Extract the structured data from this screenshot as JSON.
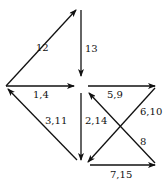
{
  "diagram": {
    "type": "directed-graph",
    "edges": [
      {
        "id": "e12",
        "label": "12",
        "from": [
          6,
          86
        ],
        "to": [
          76,
          10
        ]
      },
      {
        "id": "e13",
        "label": "13",
        "from": [
          81,
          10
        ],
        "to": [
          81,
          76
        ]
      },
      {
        "id": "e14",
        "label": "1,4",
        "from": [
          6,
          86
        ],
        "to": [
          74,
          86
        ]
      },
      {
        "id": "e311",
        "label": "3,11",
        "from": [
          77,
          160
        ],
        "to": [
          8,
          89
        ]
      },
      {
        "id": "e214",
        "label": "2,14",
        "from": [
          81,
          93
        ],
        "to": [
          81,
          160
        ]
      },
      {
        "id": "e59",
        "label": "5,9",
        "from": [
          88,
          86
        ],
        "to": [
          155,
          86
        ]
      },
      {
        "id": "e610",
        "label": "6,10",
        "from": [
          155,
          88
        ],
        "to": [
          88,
          162
        ]
      },
      {
        "id": "e8",
        "label": "8",
        "from": [
          155,
          163
        ],
        "to": [
          89,
          93
        ]
      },
      {
        "id": "e715",
        "label": "7,15",
        "from": [
          90,
          165
        ],
        "to": [
          155,
          165
        ]
      }
    ],
    "labels": [
      {
        "text": "12",
        "x": 36,
        "y": 43
      },
      {
        "text": "13",
        "x": 85,
        "y": 44
      },
      {
        "text": "1,4",
        "x": 33,
        "y": 90
      },
      {
        "text": "3,11",
        "x": 45,
        "y": 116
      },
      {
        "text": "2,14",
        "x": 85,
        "y": 116
      },
      {
        "text": "5,9",
        "x": 107,
        "y": 90
      },
      {
        "text": "6,10",
        "x": 140,
        "y": 107
      },
      {
        "text": "8",
        "x": 140,
        "y": 137
      },
      {
        "text": "7,15",
        "x": 110,
        "y": 170
      }
    ]
  }
}
